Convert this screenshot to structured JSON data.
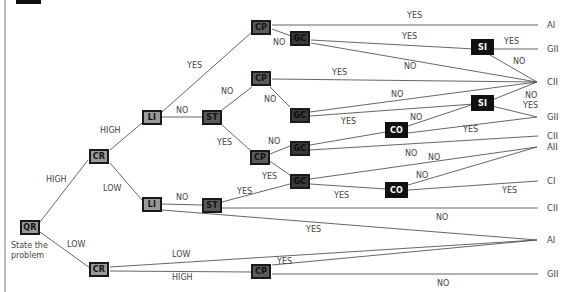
{
  "diagram": {
    "type": "decision-tree",
    "start_caption_line1": "State the",
    "start_caption_line2": "problem",
    "nodes": {
      "qr": "QR",
      "cr_high": "CR",
      "cr_low": "CR",
      "li_top": "LI",
      "li_bottom": "LI",
      "st_top": "ST",
      "st_bottom": "ST",
      "cp_1": "CP",
      "cp_2": "CP",
      "cp_3": "CP",
      "cp_4": "CP",
      "gc_1": "GC",
      "gc_2": "GC",
      "gc_3": "GC",
      "gc_4": "GC",
      "si_1": "SI",
      "si_2": "SI",
      "co_1": "CO",
      "co_2": "CO"
    },
    "edge_labels": {
      "qr_high": "HIGH",
      "qr_low": "LOW",
      "cr_high": "HIGH",
      "cr_low": "LOW",
      "li_yes": "YES",
      "li_no": "NO",
      "st_no": "NO",
      "st_yes": "YES",
      "cp1_yes": "YES",
      "cp1_no": "NO",
      "gc1_yes": "YES",
      "gc1_no": "NO",
      "si1_yes": "YES",
      "si1_no": "NO",
      "cp2_yes": "YES",
      "cp2_no": "NO",
      "gc2_no": "NO",
      "gc2_yes": "YES",
      "co1_no": "NO",
      "si2_no": "NO",
      "si2_yes": "YES",
      "co1_yes": "YES",
      "cp3_no": "NO",
      "cp3_yes": "YES",
      "gc3_no": "NO",
      "gc3_no2": "NO",
      "gc4_yes": "YES",
      "co2_no": "NO",
      "co2_yes": "YES",
      "li2_no": "NO",
      "st2_yes": "YES",
      "st2_no": "NO",
      "li2_yes": "YES",
      "cr2_low": "LOW",
      "cr2_high": "HIGH",
      "cp4_yes": "YES",
      "cp4_no": "NO"
    },
    "outcomes": {
      "o1": "AI",
      "o2": "GII",
      "o3": "CII",
      "o4": "GII",
      "o5": "CII",
      "o6": "AII",
      "o7": "CI",
      "o8": "CII",
      "o9": "AI",
      "o10": "GII"
    },
    "colors": {
      "line": "#555555",
      "node_light": "#9a9a9a",
      "node_mid": "#5b5b5b",
      "node_dark": "#3a3a3a",
      "node_black": "#111111",
      "text": "#444444"
    }
  }
}
